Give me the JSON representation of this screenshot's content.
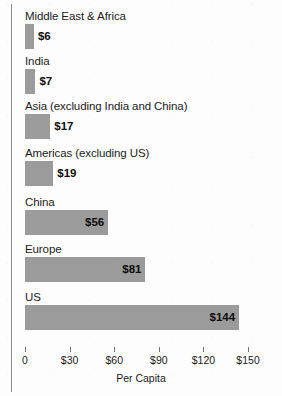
{
  "chart_data": {
    "type": "bar",
    "orientation": "horizontal",
    "title": "",
    "xlabel": "Per Capita",
    "ylabel": "",
    "xlim": [
      0,
      150
    ],
    "grid": false,
    "legend": false,
    "value_prefix": "$",
    "categories": [
      "Middle East & Africa",
      "India",
      "Asia (excluding India and China)",
      "Americas (excluding US)",
      "China",
      "Europe",
      "US"
    ],
    "values": [
      6,
      7,
      17,
      19,
      56,
      81,
      144
    ],
    "value_labels": [
      "$6",
      "$7",
      "$17",
      "$19",
      "$56",
      "$81",
      "$144"
    ],
    "ticks": [
      0,
      30,
      60,
      90,
      120,
      150
    ],
    "tick_labels": [
      "0",
      "$30",
      "$60",
      "$90",
      "$120",
      "$150"
    ],
    "bar_color": "#9b9b9b",
    "text_color": "#1c1c1c",
    "background_color": "#fdfdfd"
  }
}
